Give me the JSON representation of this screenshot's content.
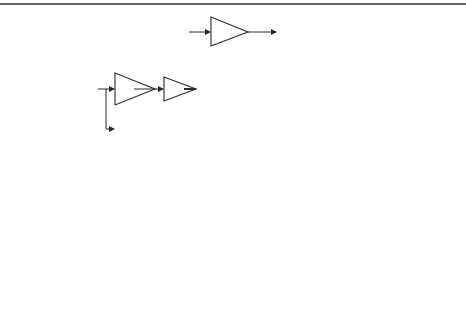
{
  "diagram": {
    "top_rule_color": "#333333",
    "captions": {
      "a": "(a)",
      "b": "(b)",
      "c": "(c)"
    },
    "symbols": {
      "sum": "Σ",
      "plus": "+",
      "delay": "Z",
      "delay_exp": "−1"
    },
    "part_a": {
      "gain": "ω0",
      "gain_base": "ω",
      "gain_sub": "0"
    },
    "part_b": {
      "gain_main_base": "ω",
      "gain_main_sub": "0",
      "gain_main_sup": "2",
      "t_block": "T",
      "half": "1/2",
      "gain_ff_a": "a",
      "gain_ff_a_sub": "2",
      "gain_ff_w": "ω",
      "gain_ff_w_sub": "0"
    },
    "part_c": {
      "gain_main_base": "ω",
      "gain_main_sub": "0",
      "gain_main_sup": "3",
      "t_block": "T",
      "half": "1/2",
      "gain_ff1_a": "a",
      "gain_ff1_a_sub": "1",
      "gain_ff1_w": "ω",
      "gain_ff1_w_sub": "0",
      "gain_ff1_w_sup": "2",
      "gain_ff2_b": "b",
      "gain_ff2_b_sub": "1",
      "gain_ff2_w": "ω",
      "gain_ff2_w_sub": "0"
    }
  }
}
